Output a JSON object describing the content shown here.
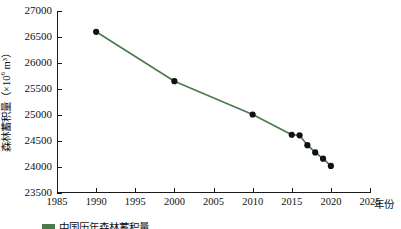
{
  "chart_data": {
    "type": "line",
    "title": "",
    "xlabel": "年份",
    "ylabel": "森林蓄积量（×10⁶ m³）",
    "ylabel_parts": {
      "prefix": "森林蓄积量（×10",
      "exponent": "6",
      "suffix": " m³）"
    },
    "xlim": [
      1985,
      2025
    ],
    "ylim": [
      23500,
      27000
    ],
    "xticks": [
      1985,
      1990,
      1995,
      2000,
      2005,
      2010,
      2015,
      2020,
      2025
    ],
    "yticks": [
      23500,
      24000,
      24500,
      25000,
      25500,
      26000,
      26500,
      27000
    ],
    "grid": false,
    "legend": "",
    "series": [
      {
        "name": "森林蓄积量",
        "line_color": "#4a7a4a",
        "marker_color": "#111111",
        "x": [
          1990,
          2000,
          2010,
          2015,
          2016,
          2017,
          2018,
          2019,
          2020
        ],
        "values": [
          26600,
          25650,
          25010,
          24620,
          24610,
          24420,
          24280,
          24160,
          24020
        ]
      }
    ]
  },
  "caption": {
    "text": "中国历年森林蓄积量"
  }
}
